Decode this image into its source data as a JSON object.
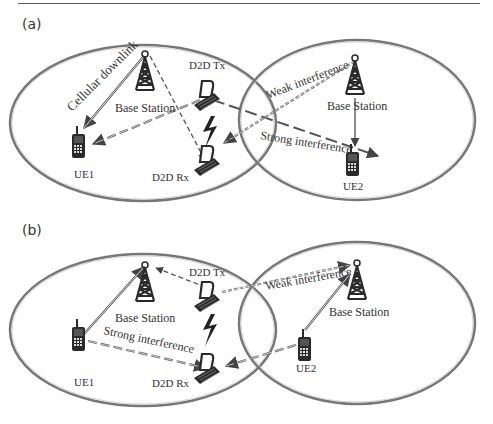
{
  "panels": [
    {
      "label": "(a)",
      "left_cell": {
        "base_station": "Base  Station",
        "ue": "UE1",
        "d2d_tx": "D2D  Tx",
        "d2d_rx": "D2D  Rx",
        "link_label": "Cellular downlink"
      },
      "right_cell": {
        "base_station": "Base  Station",
        "ue": "UE2"
      },
      "interference": {
        "weak": "Weak interference",
        "strong": "Strong interference"
      }
    },
    {
      "label": "(b)",
      "left_cell": {
        "base_station": "Base  Station",
        "ue": "UE1",
        "d2d_tx": "D2D  Tx",
        "d2d_rx": "D2D  Rx"
      },
      "right_cell": {
        "base_station": "Base Station",
        "ue": "UE2"
      },
      "interference": {
        "weak": "Weak interference",
        "strong": "Strong interference"
      }
    }
  ],
  "colors": {
    "line": "#555555",
    "icon": "#2a2a2a",
    "cell": "#666666"
  }
}
